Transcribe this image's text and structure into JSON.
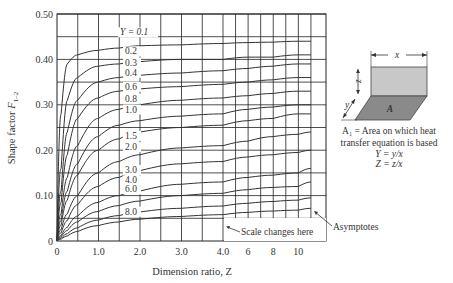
{
  "chart_data": {
    "type": "line",
    "title": "",
    "xlabel": "Dimension ratio, Z",
    "ylabel": "Shape factor F1–2",
    "ylim": [
      0,
      0.5
    ],
    "xlim_note": "Linear 0–4.0, scale changes at 4.0 to 4–11",
    "x_ticks": [
      "0",
      "1.0",
      "2.0",
      "3.0",
      "4.0",
      "6",
      "8",
      "10"
    ],
    "y_ticks": [
      "0",
      "0.10",
      "0.20",
      "0.30",
      "0.40",
      "0.50"
    ],
    "grid": true,
    "x": [
      0,
      0.1,
      0.25,
      0.5,
      1.0,
      1.5,
      2.0,
      3.0,
      4.0,
      6,
      8,
      10,
      11
    ],
    "series": [
      {
        "name": "Y = 0.1",
        "values": [
          0,
          0.28,
          0.39,
          0.41,
          0.42,
          0.425,
          0.43,
          0.432,
          0.435,
          0.437,
          0.438,
          0.44,
          0.44
        ]
      },
      {
        "name": "0.2",
        "values": [
          0,
          0.16,
          0.31,
          0.36,
          0.385,
          0.39,
          0.395,
          0.4,
          0.4,
          0.405,
          0.405,
          0.41,
          0.41
        ]
      },
      {
        "name": "0.3",
        "values": [
          0,
          0.11,
          0.24,
          0.31,
          0.35,
          0.36,
          0.365,
          0.37,
          0.375,
          0.38,
          0.385,
          0.39,
          0.39
        ]
      },
      {
        "name": "0.4",
        "values": [
          0,
          0.085,
          0.19,
          0.27,
          0.315,
          0.33,
          0.335,
          0.34,
          0.345,
          0.35,
          0.355,
          0.36,
          0.36
        ]
      },
      {
        "name": "0.6",
        "values": [
          0,
          0.06,
          0.14,
          0.21,
          0.27,
          0.29,
          0.3,
          0.31,
          0.315,
          0.32,
          0.325,
          0.33,
          0.33
        ]
      },
      {
        "name": "0.8",
        "values": [
          0,
          0.045,
          0.11,
          0.17,
          0.23,
          0.255,
          0.265,
          0.275,
          0.28,
          0.29,
          0.295,
          0.3,
          0.3
        ]
      },
      {
        "name": "1.0",
        "values": [
          0,
          0.035,
          0.09,
          0.145,
          0.2,
          0.225,
          0.24,
          0.25,
          0.255,
          0.265,
          0.27,
          0.28,
          0.28
        ]
      },
      {
        "name": "1.5",
        "values": [
          0,
          0.025,
          0.06,
          0.1,
          0.15,
          0.175,
          0.19,
          0.205,
          0.21,
          0.22,
          0.23,
          0.235,
          0.24
        ]
      },
      {
        "name": "2.0",
        "values": [
          0,
          0.018,
          0.045,
          0.08,
          0.12,
          0.14,
          0.155,
          0.17,
          0.175,
          0.185,
          0.19,
          0.195,
          0.2
        ]
      },
      {
        "name": "3.0",
        "values": [
          0,
          0.012,
          0.03,
          0.055,
          0.085,
          0.1,
          0.11,
          0.125,
          0.13,
          0.14,
          0.145,
          0.15,
          0.16
        ]
      },
      {
        "name": "4.0",
        "values": [
          0,
          0.009,
          0.023,
          0.042,
          0.065,
          0.078,
          0.088,
          0.1,
          0.105,
          0.113,
          0.118,
          0.12,
          0.13
        ]
      },
      {
        "name": "6.0",
        "values": [
          0,
          0.006,
          0.016,
          0.029,
          0.046,
          0.056,
          0.064,
          0.072,
          0.077,
          0.083,
          0.087,
          0.09,
          0.095
        ]
      },
      {
        "name": "8.0",
        "values": [
          0,
          0.004,
          0.011,
          0.021,
          0.034,
          0.042,
          0.048,
          0.054,
          0.058,
          0.063,
          0.066,
          0.068,
          0.072
        ]
      }
    ],
    "annotations": [
      "Scale changes here",
      "Asymptotes"
    ]
  },
  "labels": {
    "y_axis_title_main": "Shape factor ",
    "y_axis_title_sub": "1–2",
    "y_axis_title_var": "F",
    "x_axis_title": "Dimension ratio, Z",
    "series_prefix": "Y = 0.1",
    "scale_note": "Scale changes here",
    "asymptotes_note": "Asymptotes"
  },
  "diagram": {
    "x_label": "x",
    "z_label": "z",
    "y_label": "y",
    "area_label": "A",
    "caption_line1": "A₁ = Area on which heat",
    "caption_line2": "transfer equation is based",
    "eq1": "Y = y/x",
    "eq2": "Z = z/x",
    "top_color": "#c8c8c8",
    "base_color": "#8a8a8a"
  }
}
